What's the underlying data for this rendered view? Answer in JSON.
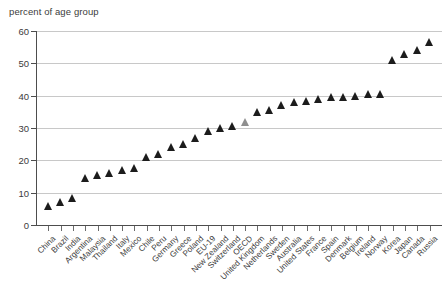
{
  "chart_data": {
    "type": "scatter",
    "title": "",
    "subtitle": "",
    "ylabel": "percent of age group",
    "xlabel": "",
    "ylim": [
      0,
      60
    ],
    "yticks": [
      0,
      10,
      20,
      30,
      40,
      50,
      60
    ],
    "grid": true,
    "grid_axis": "y",
    "legend": null,
    "marker": "triangle-up",
    "series_color": "#1c1c1c",
    "highlight_color": "#8f8f8f",
    "highlight_category": "OECD",
    "categories": [
      "China",
      "Brazil",
      "India",
      "Argentina",
      "Malaysia",
      "Thailand",
      "Italy",
      "Mexico",
      "Chile",
      "Peru",
      "Germany",
      "Greece",
      "Poland",
      "EU-19",
      "New Zealand",
      "Switzerland",
      "OECD",
      "United Kingdom",
      "Netherlands",
      "Sweden",
      "Australia",
      "United States",
      "France",
      "Spain",
      "Denmark",
      "Belgium",
      "Ireland",
      "Norway",
      "Korea",
      "Japan",
      "Canada",
      "Russia"
    ],
    "values": [
      6,
      7,
      8.5,
      14.5,
      15.5,
      16,
      17,
      17.5,
      21,
      22,
      24,
      25,
      27,
      29,
      30,
      30.5,
      32,
      35,
      35.5,
      37,
      38,
      38.5,
      39,
      39.5,
      39.5,
      40,
      40.5,
      40.5,
      51,
      53,
      54,
      56.5
    ],
    "x_tick_count": 32
  },
  "axis": {
    "y_title": "percent of age group",
    "y_tick_labels": [
      "0",
      "10",
      "20",
      "30",
      "40",
      "50",
      "60"
    ]
  }
}
